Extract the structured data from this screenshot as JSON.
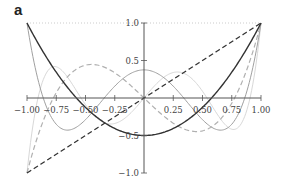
{
  "panel_label": "a",
  "chart_data": {
    "type": "line",
    "title": "",
    "xlabel": "",
    "ylabel": "",
    "xlim": [
      -1,
      1
    ],
    "ylim": [
      -1,
      1
    ],
    "grid": false,
    "x_ticks": [
      "-1.00",
      "-0.75",
      "-0.50",
      "-0.25",
      "0.25",
      "0.50",
      "0.75",
      "1.00"
    ],
    "x_tick_values": [
      -1,
      -0.75,
      -0.5,
      -0.25,
      0.25,
      0.5,
      0.75,
      1
    ],
    "y_ticks": [
      "1.0",
      "0.5",
      "-0.5",
      "-1.0"
    ],
    "y_tick_values": [
      1,
      0.5,
      -0.5,
      -1
    ],
    "series": [
      {
        "name": "P0",
        "formula": "1",
        "style": "dotted",
        "color": "#c8c8c8",
        "x": [
          -1,
          1
        ],
        "values": [
          1,
          1
        ]
      },
      {
        "name": "P1",
        "formula": "x",
        "style": "dashed",
        "color": "#333333",
        "x": [
          -1,
          1
        ],
        "values": [
          -1,
          1
        ]
      },
      {
        "name": "P2",
        "formula": "(3x^2-1)/2",
        "style": "solid",
        "color": "#333333",
        "x": [
          -1,
          -0.5,
          0,
          0.5,
          1
        ],
        "values": [
          1,
          -0.125,
          -0.5,
          -0.125,
          1
        ]
      },
      {
        "name": "P3",
        "formula": "(5x^3-3x)/2",
        "style": "dashed",
        "color": "#b0b0b0",
        "x": [
          -1,
          -0.45,
          0,
          0.45,
          1
        ],
        "values": [
          -1,
          0.42,
          0,
          -0.42,
          1
        ]
      },
      {
        "name": "P4",
        "formula": "(35x^4-30x^2+3)/8",
        "style": "solid",
        "color": "#a0a0a0",
        "x": [
          -1,
          -0.65,
          0,
          0.65,
          1
        ],
        "values": [
          1,
          -0.43,
          0.375,
          -0.43,
          1
        ]
      },
      {
        "name": "P5",
        "formula": "(63x^5-70x^3+15x)/8",
        "style": "solid",
        "color": "#d8d8d8",
        "x": [
          -1,
          -0.77,
          -0.29,
          0.29,
          0.77,
          1
        ],
        "values": [
          -1,
          0.42,
          -0.35,
          0.35,
          -0.42,
          1
        ]
      }
    ]
  }
}
